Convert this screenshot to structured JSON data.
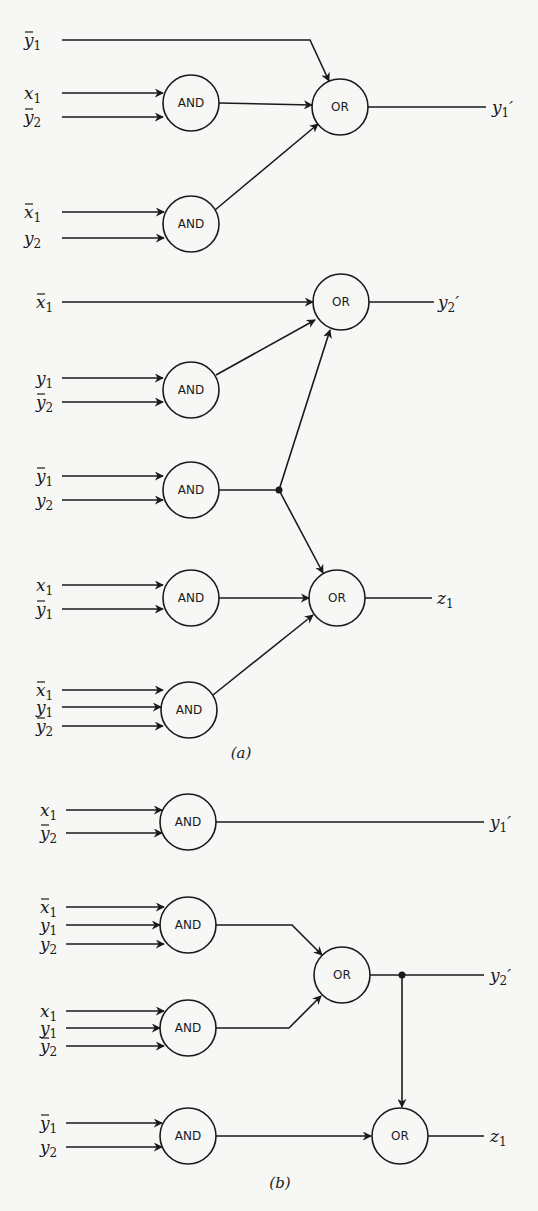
{
  "figure": {
    "parts": [
      {
        "id": "a",
        "caption": "(a)",
        "caption_pos": [
          241,
          758
        ],
        "gates": [
          {
            "id": "a_and1",
            "type": "AND",
            "label": "AND",
            "cx": 191,
            "cy": 103
          },
          {
            "id": "a_and2",
            "type": "AND",
            "label": "AND",
            "cx": 191,
            "cy": 224
          },
          {
            "id": "a_or1",
            "type": "OR",
            "label": "OR",
            "cx": 340,
            "cy": 107
          },
          {
            "id": "a_and3",
            "type": "AND",
            "label": "AND",
            "cx": 191,
            "cy": 390
          },
          {
            "id": "a_and4",
            "type": "AND",
            "label": "AND",
            "cx": 191,
            "cy": 490
          },
          {
            "id": "a_or2",
            "type": "OR",
            "label": "OR",
            "cx": 341,
            "cy": 302
          },
          {
            "id": "a_and5",
            "type": "AND",
            "label": "AND",
            "cx": 191,
            "cy": 598
          },
          {
            "id": "a_and6",
            "type": "AND",
            "label": "AND",
            "cx": 189,
            "cy": 710
          },
          {
            "id": "a_or3",
            "type": "OR",
            "label": "OR",
            "cx": 337,
            "cy": 598
          }
        ],
        "inputs": [
          {
            "name": "y1",
            "bar": true,
            "x": 28,
            "y": 40
          },
          {
            "name": "x1",
            "bar": false,
            "x": 28,
            "y": 93
          },
          {
            "name": "y2",
            "bar": true,
            "x": 28,
            "y": 117
          },
          {
            "name": "x1",
            "bar": true,
            "x": 28,
            "y": 212
          },
          {
            "name": "y2",
            "bar": false,
            "x": 28,
            "y": 238
          },
          {
            "name": "x1",
            "bar": true,
            "x": 40,
            "y": 302
          },
          {
            "name": "y1",
            "bar": false,
            "x": 40,
            "y": 378
          },
          {
            "name": "y2",
            "bar": true,
            "x": 40,
            "y": 402
          },
          {
            "name": "y1",
            "bar": true,
            "x": 40,
            "y": 476
          },
          {
            "name": "y2",
            "bar": false,
            "x": 40,
            "y": 500
          },
          {
            "name": "x1",
            "bar": false,
            "x": 40,
            "y": 585
          },
          {
            "name": "y1",
            "bar": true,
            "x": 40,
            "y": 609
          },
          {
            "name": "x1",
            "bar": true,
            "x": 40,
            "y": 690
          },
          {
            "name": "y1",
            "bar": false,
            "x": 40,
            "y": 707
          },
          {
            "name": "y2",
            "bar": true,
            "x": 40,
            "y": 726
          }
        ],
        "outputs": [
          {
            "name": "y1",
            "prime": true,
            "x": 492,
            "y": 107
          },
          {
            "name": "y2",
            "prime": true,
            "x": 438,
            "y": 302
          },
          {
            "name": "z1",
            "prime": false,
            "x": 437,
            "y": 598
          }
        ]
      },
      {
        "id": "b",
        "caption": "(b)",
        "caption_pos": [
          280,
          1188
        ],
        "gates": [
          {
            "id": "b_and1",
            "type": "AND",
            "label": "AND",
            "cx": 188,
            "cy": 822
          },
          {
            "id": "b_and2",
            "type": "AND",
            "label": "AND",
            "cx": 188,
            "cy": 925
          },
          {
            "id": "b_or1",
            "type": "OR",
            "label": "OR",
            "cx": 342,
            "cy": 975
          },
          {
            "id": "b_and3",
            "type": "AND",
            "label": "AND",
            "cx": 188,
            "cy": 1028
          },
          {
            "id": "b_and4",
            "type": "AND",
            "label": "AND",
            "cx": 188,
            "cy": 1136
          },
          {
            "id": "b_or2",
            "type": "OR",
            "label": "OR",
            "cx": 400,
            "cy": 1136
          }
        ],
        "inputs": [
          {
            "name": "x1",
            "bar": false,
            "x": 44,
            "y": 810
          },
          {
            "name": "y2",
            "bar": true,
            "x": 44,
            "y": 833
          },
          {
            "name": "x1",
            "bar": true,
            "x": 44,
            "y": 907
          },
          {
            "name": "y1",
            "bar": false,
            "x": 44,
            "y": 925
          },
          {
            "name": "y2",
            "bar": false,
            "x": 44,
            "y": 944
          },
          {
            "name": "x1",
            "bar": false,
            "x": 44,
            "y": 1011
          },
          {
            "name": "y1",
            "bar": false,
            "x": 44,
            "y": 1028
          },
          {
            "name": "y2",
            "bar": true,
            "x": 44,
            "y": 1046
          },
          {
            "name": "y1",
            "bar": true,
            "x": 44,
            "y": 1123
          },
          {
            "name": "y2",
            "bar": false,
            "x": 44,
            "y": 1147
          }
        ],
        "outputs": [
          {
            "name": "y1",
            "prime": true,
            "x": 490,
            "y": 822
          },
          {
            "name": "y2",
            "prime": true,
            "x": 490,
            "y": 975
          },
          {
            "name": "z1",
            "prime": false,
            "x": 490,
            "y": 1136
          }
        ]
      }
    ],
    "gate_radius": 28
  }
}
